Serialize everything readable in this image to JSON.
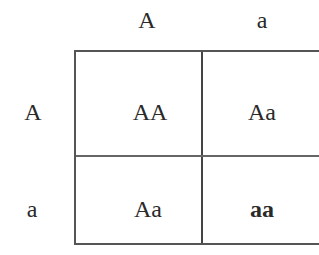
{
  "punnett_square": {
    "column_headers": [
      "A",
      "a"
    ],
    "row_headers": [
      "A",
      "a"
    ],
    "cells": [
      [
        "AA",
        "Aa"
      ],
      [
        "Aa",
        "aa"
      ]
    ]
  }
}
